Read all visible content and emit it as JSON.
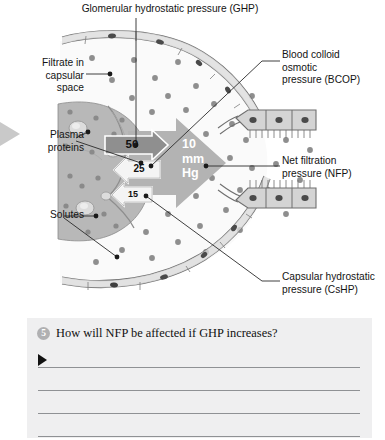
{
  "figure": {
    "labels": {
      "ghp": "Glomerular hydrostatic pressure (GHP)",
      "filtrate": "Filtrate in\ncapsular\nspace",
      "plasma_proteins": "Plasma\nproteins",
      "solutes": "Solutes",
      "bcop": "Blood colloid\nosmotic\npressure (BCOP)",
      "nfp": "Net filtration\npressure (NFP)",
      "cshp": "Capsular hydrostatic\npressure (CsHP)"
    },
    "pressures": {
      "ghp_value": "50",
      "bcop_value": "25",
      "cshp_value": "15",
      "nfp_value": "10\nmm\nHg"
    },
    "colors": {
      "capillary_fill": "#b5b5b5",
      "capsule_fill": "#f7f7f7",
      "arrow_fill": "#b0b0b0",
      "outline": "#555555",
      "dot": "#8c8c8c",
      "panel_bg": "#efeff0",
      "line": "#8f9194",
      "badge": "#b0b0b2"
    }
  },
  "question": {
    "number": "5",
    "text": "How will NFP be affected if GHP increases?",
    "answer_lines": [
      "",
      "",
      "",
      ""
    ]
  }
}
